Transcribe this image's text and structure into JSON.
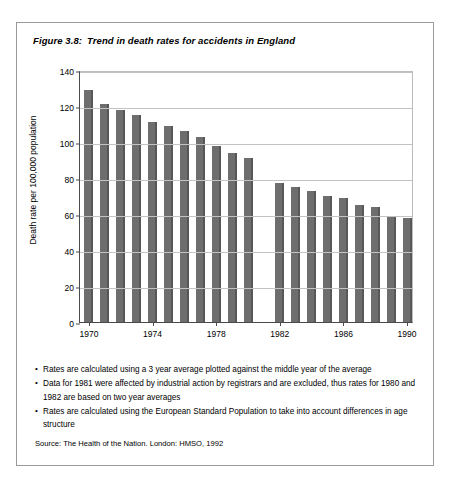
{
  "figure": {
    "number": "Figure 3.8:",
    "title": "Trend in death rates for accidents in England"
  },
  "notes": [
    "Rates are calculated using a 3 year average plotted against the middle year of the average",
    "Data for 1981 were affected by industrial action by registrars and are excluded, thus rates for 1980 and 1982 are based on two year averages",
    "Rates are calculated using the European Standard Population to take into account differences in age structure"
  ],
  "source": "Source: The Health of the Nation. London: HMSO, 1992",
  "colors": {
    "bar_fill": "#6e6e6e",
    "bar_edge": "#585858",
    "axis": "#4a4a4a",
    "grid": "#c3c3c3",
    "border": "#9a9a9a"
  },
  "chart_data": {
    "type": "bar",
    "title": "Trend in death rates for accidents in England",
    "xlabel": "",
    "ylabel": "Death rate per 100,000 population",
    "ylim": [
      0,
      140
    ],
    "ytick_values": [
      0,
      20,
      40,
      60,
      80,
      100,
      120,
      140
    ],
    "ytick_labels": [
      "0",
      "20",
      "40",
      "60",
      "80",
      "100",
      "120",
      "140"
    ],
    "xtick_labels": [
      "1970",
      "1974",
      "1978",
      "1982",
      "1986",
      "1990"
    ],
    "grid": true,
    "legend": "none",
    "categories": [
      "1970",
      "1971",
      "1972",
      "1973",
      "1974",
      "1975",
      "1976",
      "1977",
      "1978",
      "1979",
      "1980",
      "1981",
      "1982",
      "1983",
      "1984",
      "1985",
      "1986",
      "1987",
      "1988",
      "1989",
      "1990"
    ],
    "values": [
      129,
      121,
      118,
      115,
      111,
      109,
      106,
      103,
      98,
      94,
      91,
      null,
      77,
      75,
      73,
      70,
      69,
      65,
      64,
      59,
      58
    ],
    "missing_categories": [
      "1981"
    ],
    "missing_note": "1981 excluded due to industrial action by registrars"
  }
}
